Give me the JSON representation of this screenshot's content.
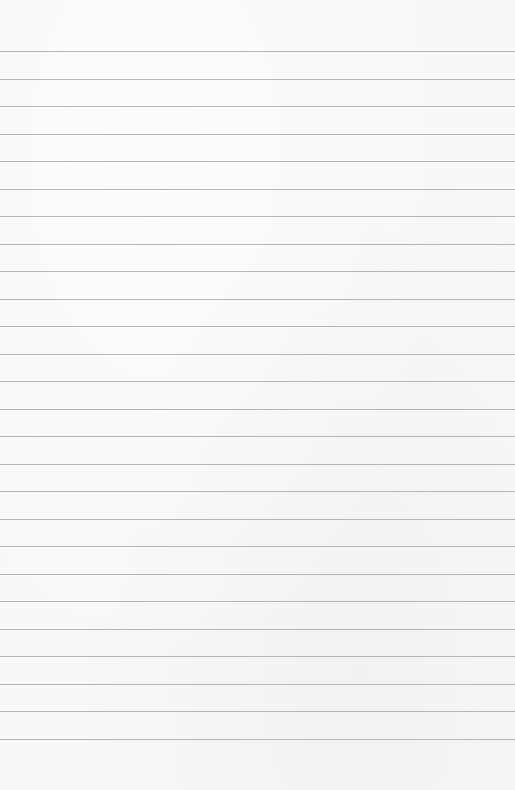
{
  "page": {
    "type": "ruled-paper",
    "background_color": "#f8f8f7",
    "rule_color": "#a9a9a9",
    "rule_count": 26,
    "first_rule_y": 51,
    "rule_spacing": 27.5,
    "text": ""
  }
}
